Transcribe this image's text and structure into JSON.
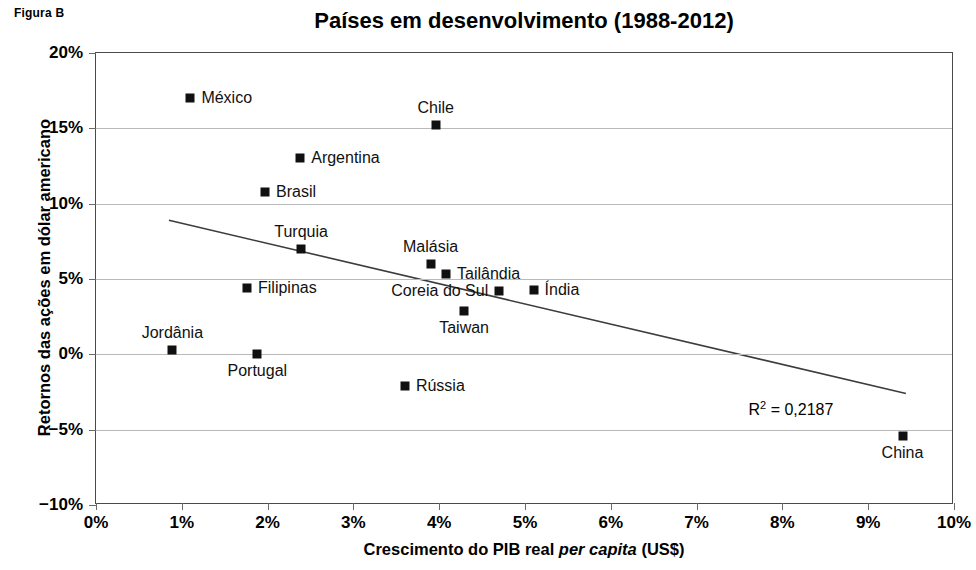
{
  "figure_tag": "Figura B",
  "chart_data": {
    "type": "scatter",
    "title": "Países em desenvolvimento (1988-2012)",
    "xlabel_prefix": "Crescimento do PIB real ",
    "xlabel_italic": "per capita",
    "xlabel_suffix": " (US$)",
    "xlabel": "Crescimento do PIB real per capita (US$)",
    "ylabel": "Retornos das ações em dólar americano",
    "xlim": [
      0,
      10
    ],
    "ylim": [
      -10,
      20
    ],
    "xticks": [
      0,
      1,
      2,
      3,
      4,
      5,
      6,
      7,
      8,
      9,
      10
    ],
    "yticks": [
      20,
      15,
      10,
      5,
      0,
      -5,
      -10
    ],
    "xticklabels": [
      "0%",
      "1%",
      "2%",
      "3%",
      "4%",
      "5%",
      "6%",
      "7%",
      "8%",
      "9%",
      "10%"
    ],
    "yticklabels": [
      "20%",
      "15%",
      "10%",
      "5%",
      "0%",
      "−5%",
      "−10%"
    ],
    "grid": "horizontal",
    "legend": "none",
    "marker_color": "#101010",
    "trendline_color": "#3c3c3c",
    "gridline_color": "#b9b9b9",
    "points": [
      {
        "name": "México",
        "x": 1.1,
        "y": 17.0,
        "label_pos": "right"
      },
      {
        "name": "Chile",
        "x": 3.96,
        "y": 15.2,
        "label_pos": "above"
      },
      {
        "name": "Argentina",
        "x": 2.38,
        "y": 13.0,
        "label_pos": "right"
      },
      {
        "name": "Brasil",
        "x": 1.97,
        "y": 10.8,
        "label_pos": "right"
      },
      {
        "name": "Turquia",
        "x": 2.39,
        "y": 7.0,
        "label_pos": "above"
      },
      {
        "name": "Malásia",
        "x": 3.9,
        "y": 6.0,
        "label_pos": "above"
      },
      {
        "name": "Tailândia",
        "x": 4.08,
        "y": 5.3,
        "label_pos": "right"
      },
      {
        "name": "Filipinas",
        "x": 1.76,
        "y": 4.4,
        "label_pos": "right"
      },
      {
        "name": "Índia",
        "x": 5.1,
        "y": 4.3,
        "label_pos": "right"
      },
      {
        "name": "Coreia do Sul",
        "x": 4.7,
        "y": 4.2,
        "label_pos": "left"
      },
      {
        "name": "Taiwan",
        "x": 4.29,
        "y": 2.9,
        "label_pos": "below"
      },
      {
        "name": "Jordânia",
        "x": 0.89,
        "y": 0.3,
        "label_pos": "above"
      },
      {
        "name": "Portugal",
        "x": 1.88,
        "y": 0.05,
        "label_pos": "below"
      },
      {
        "name": "Rússia",
        "x": 3.6,
        "y": -2.1,
        "label_pos": "right"
      },
      {
        "name": "China",
        "x": 9.4,
        "y": -5.4,
        "label_pos": "below"
      }
    ],
    "trendline": {
      "x0": 0.85,
      "y0": 8.9,
      "x1": 9.44,
      "y1": -2.6
    },
    "r2_label": "R² = 0,2187",
    "r2_value": 0.2187,
    "r2_prefix": "R",
    "r2_exponent": "2",
    "r2_suffix": " = 0,2187",
    "r2_pos": {
      "x": 8.1,
      "y": -3.6
    }
  }
}
